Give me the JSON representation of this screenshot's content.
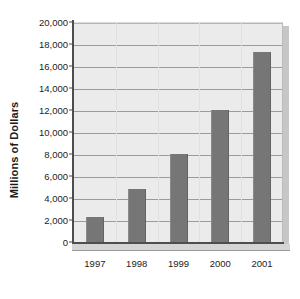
{
  "chart_data": {
    "type": "bar",
    "title": "",
    "subtitle": "",
    "xlabel": "",
    "ylabel": "Millions of Dollars",
    "categories": [
      "1997",
      "1998",
      "1999",
      "2000",
      "2001"
    ],
    "values": [
      2300,
      4800,
      8000,
      12000,
      17300
    ],
    "series": [
      {
        "name": "Millions of Dollars",
        "values": [
          2300,
          4800,
          8000,
          12000,
          17300
        ]
      }
    ],
    "ylim": [
      0,
      20000
    ],
    "ytick_values": [
      0,
      2000,
      4000,
      6000,
      8000,
      10000,
      12000,
      14000,
      16000,
      18000,
      20000
    ],
    "ytick_labels": [
      "0",
      "2,000",
      "4,000",
      "6,000",
      "8,000",
      "10,000",
      "12,000",
      "14,000",
      "16,000",
      "18,000",
      "20,000"
    ],
    "ytick_step": 2000,
    "grid": true,
    "grid_axis": "y",
    "legend": false,
    "legend_position": "none",
    "annotations": [],
    "colors": {
      "bar_fill": "#767676",
      "plot_background": "#ebebeb",
      "gridline": "#9b9b9b",
      "axis_line": "#4e4e4e",
      "shadow": "#c6c6c6",
      "text": "#1c1c1c",
      "page_background": "#ffffff"
    }
  }
}
